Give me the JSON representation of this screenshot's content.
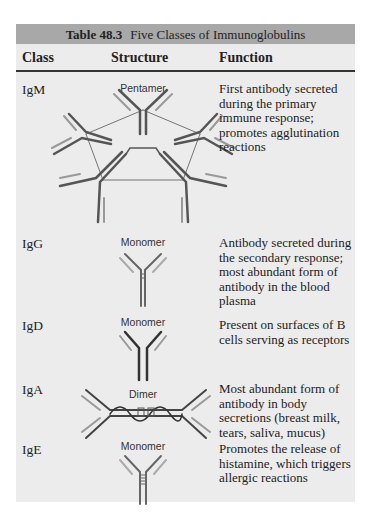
{
  "table": {
    "number": "Table 48.3",
    "title": "Five Classes of Immunoglobulins",
    "columns": [
      "Class",
      "Structure",
      "Function"
    ],
    "rows": [
      {
        "class": "IgM",
        "structure": "Pentamer",
        "function": "First antibody secreted during the primary immune response; promotes agglutination reactions"
      },
      {
        "class": "IgG",
        "structure": "Monomer",
        "function": "Antibody secreted during the secondary response; most abundant form of antibody in the blood plasma"
      },
      {
        "class": "IgD",
        "structure": "Monomer",
        "function": "Present on surfaces of B cells serving as receptors"
      },
      {
        "class": "IgA",
        "structure": "Dimer",
        "function": "Most abundant form of antibody in body secretions (breast milk, tears, saliva, mucus)"
      },
      {
        "class": "IgE",
        "structure": "Monomer",
        "function": "Promotes the release of histamine, which triggers allergic reactions"
      }
    ]
  },
  "colors": {
    "caption_band": "#a8a8a8",
    "table_bg": "#ececec",
    "heavy_chain": "#555555",
    "light_chain": "#9a9a9a"
  }
}
